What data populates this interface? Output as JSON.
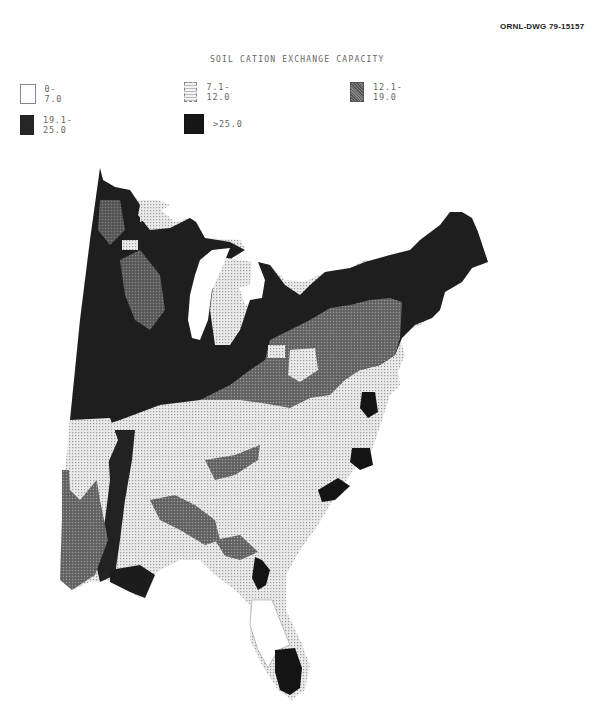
{
  "document": {
    "drawing_number": "ORNL-DWG 79-15157",
    "title": "SOIL CATION EXCHANGE CAPACITY"
  },
  "legend": {
    "items": [
      {
        "label": "0-7.0",
        "fill": "#ffffff",
        "pattern": "blank"
      },
      {
        "label": "7.1-12.0",
        "fill": "#e4e4e4",
        "pattern": "fine-dots"
      },
      {
        "label": "12.1-19.0",
        "fill": "#6a6a6a",
        "pattern": "cross-hatch"
      },
      {
        "label": "19.1-25.0",
        "fill": "#262626",
        "pattern": "dense"
      },
      {
        "label": ">25.0",
        "fill": "#141414",
        "pattern": "solid"
      }
    ]
  },
  "map": {
    "region": "Eastern United States",
    "classes": [
      "0-7.0",
      "7.1-12.0",
      "12.1-19.0",
      "19.1-25.0",
      ">25.0"
    ],
    "colors": {
      "class_0_7": "#ffffff",
      "class_7_12": "#e0e0e0",
      "class_12_19": "#6e6e6e",
      "class_19_25": "#2a2a2a",
      "class_gt25": "#161616"
    }
  }
}
